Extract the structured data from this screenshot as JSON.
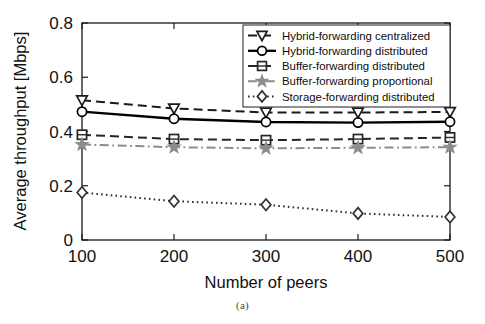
{
  "figure": {
    "caption": "(a)"
  },
  "chart_data": {
    "type": "line",
    "title": "",
    "xlabel": "Number of peers",
    "ylabel": "Average throughput [Mbps]",
    "x": [
      100,
      200,
      300,
      400,
      500
    ],
    "xtick_labels": [
      "100",
      "200",
      "300",
      "400",
      "500"
    ],
    "ytick_labels": [
      "0",
      "0.2",
      "0.4",
      "0.6",
      "0.8"
    ],
    "ytick_values": [
      0,
      0.2,
      0.4,
      0.6,
      0.8
    ],
    "xlim": [
      100,
      500
    ],
    "ylim": [
      0,
      0.8
    ],
    "grid": false,
    "legend_position": "top-right",
    "series": [
      {
        "name": "Hybrid-forwarding centralized",
        "values": [
          0.515,
          0.485,
          0.47,
          0.47,
          0.472
        ],
        "marker": "triangle-down",
        "linestyle": "dashed",
        "color": "#1a1a1a"
      },
      {
        "name": "Hybrid-forwarding distributed",
        "values": [
          0.473,
          0.447,
          0.435,
          0.433,
          0.436
        ],
        "marker": "circle",
        "linestyle": "solid",
        "color": "#000000"
      },
      {
        "name": "Buffer-forwarding distributed",
        "values": [
          0.388,
          0.372,
          0.368,
          0.372,
          0.378
        ],
        "marker": "square",
        "linestyle": "dashed",
        "color": "#262626"
      },
      {
        "name": "Buffer-forwarding proportional",
        "values": [
          0.352,
          0.342,
          0.338,
          0.34,
          0.342
        ],
        "marker": "star",
        "linestyle": "dashdot",
        "color": "#8c8c8c"
      },
      {
        "name": "Storage-forwarding distributed",
        "values": [
          0.175,
          0.143,
          0.13,
          0.098,
          0.085
        ],
        "marker": "diamond",
        "linestyle": "dotted",
        "color": "#303030"
      }
    ]
  }
}
